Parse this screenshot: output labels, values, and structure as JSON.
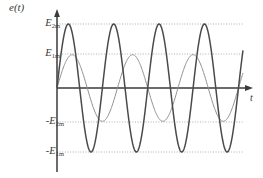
{
  "figure": {
    "title": "",
    "y_axis_label": "e(t)",
    "x_axis_label": "t",
    "background": "#ffffff",
    "axis_color": "#3a3a3a",
    "grid_color": "#9a9a9a"
  },
  "labels": {
    "e_of_t": {
      "main": "e",
      "paren_open": "(",
      "var": "t",
      "paren_close": ")"
    },
    "t": "t",
    "E2m": {
      "sign": "",
      "symbol": "E",
      "subscript": "2m"
    },
    "E1m": {
      "sign": "",
      "symbol": "E",
      "subscript": "1m"
    },
    "negE2m": {
      "sign": "-",
      "symbol": "E",
      "subscript": "2m"
    },
    "negE1m": {
      "sign": "-",
      "symbol": "E",
      "subscript": "1m"
    }
  },
  "chart_data": {
    "type": "line",
    "title": "",
    "xlabel": "t",
    "ylabel": "e(t)",
    "xlim": [
      0,
      8.2
    ],
    "ylim": [
      -1.08,
      1.08
    ],
    "grid": true,
    "grid_style": "dotted",
    "gridlines_y": [
      1.0,
      0.52,
      -0.52,
      -1.0
    ],
    "gridline_labels": [
      "E2m",
      "E1m",
      "-E2m",
      "-E1m"
    ],
    "legend": "none",
    "axis_arrows": {
      "x": "right",
      "y": "up"
    },
    "series": [
      {
        "name": "e2",
        "label": "E2m sine",
        "color": "#4a4a4a",
        "width": 1.5,
        "amplitude": 1.0,
        "amplitude_label": "E2m",
        "cycles": 4,
        "period": 2.0,
        "phase": 0.0,
        "description": "large-amplitude higher-frequency sinusoid peaking at E2m and -E1m"
      },
      {
        "name": "e1",
        "label": "E1m sine",
        "color": "#8f8f8f",
        "width": 1.0,
        "amplitude": 0.52,
        "amplitude_label": "E1m",
        "cycles": 3,
        "period": 2.667,
        "phase": 0.0,
        "description": "small-amplitude lower-frequency sinusoid peaking at E1m and -E2m"
      }
    ]
  }
}
